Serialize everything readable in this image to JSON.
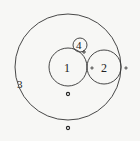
{
  "diagram": {
    "type": "circles-tangent",
    "circles": [
      {
        "label": "1",
        "cx": 68,
        "cy": 67,
        "r": 19
      },
      {
        "label": "2",
        "cx": 104,
        "cy": 67,
        "r": 17
      },
      {
        "label": "3",
        "cx": 68,
        "cy": 67,
        "r": 53
      },
      {
        "label": "4",
        "cx": 80,
        "cy": 45,
        "r": 7
      }
    ],
    "labels": {
      "c1": "1",
      "c2": "2",
      "c3": "3",
      "c4": "4"
    },
    "points": [
      {
        "x": 68,
        "y": 94,
        "kind": "ring-dot"
      },
      {
        "x": 68,
        "y": 128,
        "kind": "ring-dot"
      },
      {
        "x": 92,
        "y": 68,
        "kind": "small-dot"
      },
      {
        "x": 126,
        "y": 68,
        "kind": "small-dot"
      },
      {
        "x": 84,
        "y": 52,
        "kind": "small-dot"
      }
    ],
    "stroke_color": "#333333"
  }
}
